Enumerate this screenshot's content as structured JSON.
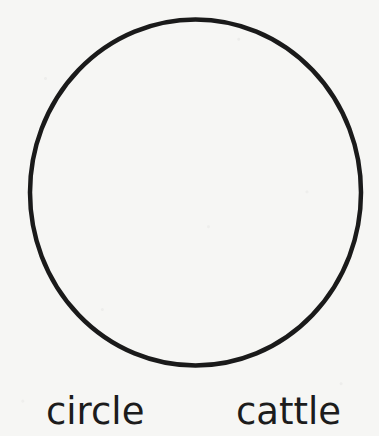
{
  "figure": {
    "shape": "circle",
    "stroke_color": "#1a1a1a",
    "background_color": "#f6f6f4"
  },
  "labels": {
    "left": "circle",
    "right": "cattle"
  }
}
